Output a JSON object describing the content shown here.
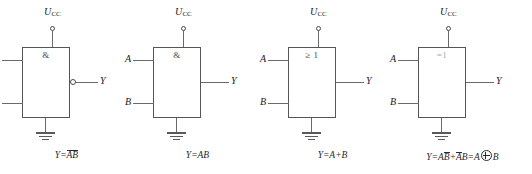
{
  "diagram": {
    "supply_label": "U",
    "supply_subscript": "CC",
    "input_a": "A",
    "input_b": "B",
    "output": "Y",
    "colors": {
      "line": "#6a6a6a",
      "box_border": "#555555",
      "text": "#1a1a1a",
      "background": "#ffffff"
    }
  },
  "gates": [
    {
      "name": "nand-gate",
      "symbol": "&",
      "symbol_faint": false,
      "inverted_output": true,
      "inputs": [
        "A",
        "B"
      ],
      "output": "Y",
      "supply": "U",
      "supply_sub": "CC",
      "formula_prefix": "Y=",
      "formula_overbar": "AB",
      "formula_suffix": "",
      "formula_plain": "Y=AB (with overbar over AB)"
    },
    {
      "name": "and-gate",
      "symbol": "&",
      "symbol_faint": false,
      "inverted_output": false,
      "inputs": [
        "A",
        "B"
      ],
      "output": "Y",
      "supply": "U",
      "supply_sub": "CC",
      "formula_prefix": "Y=",
      "formula_overbar": "",
      "formula_suffix": "AB",
      "formula_plain": "Y=AB"
    },
    {
      "name": "or-gate",
      "symbol": "≥ 1",
      "symbol_faint": false,
      "inverted_output": false,
      "inputs": [
        "A",
        "B"
      ],
      "output": "Y",
      "supply": "U",
      "supply_sub": "CC",
      "formula_prefix": "Y=",
      "formula_overbar": "",
      "formula_suffix": "A+B",
      "formula_plain": "Y=A+B"
    },
    {
      "name": "xor-gate",
      "symbol": "=1",
      "symbol_faint": true,
      "inverted_output": false,
      "inputs": [
        "A",
        "B"
      ],
      "output": "Y",
      "supply": "U",
      "supply_sub": "CC",
      "formula_prefix": "Y=",
      "formula_overbar": "",
      "formula_suffix": "",
      "formula_plain": "Y=AB̄+ĀB=A⊕B"
    }
  ],
  "xor_formula": {
    "lead": "Y=A",
    "bar1": "B",
    "plus": "+",
    "bar2": "A",
    "tail": "B=A",
    "end": "B"
  }
}
